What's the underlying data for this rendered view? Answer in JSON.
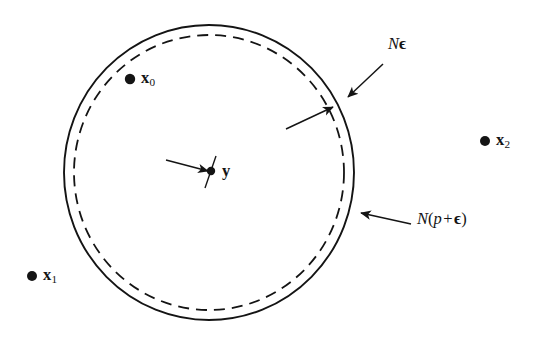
{
  "figure": {
    "name": "epsilon-neighborhood-diagram",
    "background_color": "#ffffff",
    "stroke_color": "#141414",
    "width": 548,
    "height": 346
  },
  "shapes": {
    "outer_circle": {
      "name": "N(p + ε) boundary",
      "style": "solid",
      "cx": 209,
      "cy": 172.5,
      "rx": 145,
      "ry": 147.5
    },
    "inner_circle": {
      "name": "Nε boundary",
      "style": "dashed",
      "cx": 209,
      "cy": 172.5,
      "rx": 135,
      "ry": 137.5
    }
  },
  "points": [
    {
      "id": "x0",
      "label_html": "x<sub>0</sub>",
      "text": "x0",
      "dot_x": 130,
      "dot_y": 79,
      "label_x": 141,
      "label_y": 71,
      "dot_r": 5.2,
      "inside_region": true
    },
    {
      "id": "x1",
      "label_html": "x<sub>1</sub>",
      "text": "x1",
      "dot_x": 32,
      "dot_y": 276,
      "label_x": 43,
      "label_y": 268,
      "dot_r": 5.0,
      "inside_region": false
    },
    {
      "id": "x2",
      "label_html": "x<sub>2</sub>",
      "text": "x2",
      "dot_x": 485,
      "dot_y": 141,
      "label_x": 496,
      "label_y": 133,
      "dot_r": 5.0,
      "inside_region": false
    },
    {
      "id": "y",
      "label_html": "y",
      "text": "y",
      "dot_x": 211,
      "dot_y": 171,
      "label_x": 222,
      "label_y": 163,
      "dot_r": 4.2,
      "inside_region": true
    }
  ],
  "annotations": [
    {
      "id": "n-epsilon",
      "text": "Nϵ",
      "parts": [
        {
          "kind": "italic",
          "text": "N"
        },
        {
          "kind": "epsilon",
          "text": "ϵ"
        }
      ],
      "label_x": 388,
      "label_y": 44,
      "arrow": {
        "tail_x": 383,
        "tail_y": 64,
        "tip_x": 348,
        "tip_y": 97
      }
    },
    {
      "id": "n-p-plus-epsilon",
      "text": "N(p + ϵ)",
      "parts": [
        {
          "kind": "italic",
          "text": "N"
        },
        {
          "kind": "paren",
          "text": "("
        },
        {
          "kind": "italic",
          "text": "p"
        },
        {
          "kind": "op",
          "text": "+"
        },
        {
          "kind": "epsilon",
          "text": "ϵ"
        },
        {
          "kind": "paren",
          "text": ")"
        }
      ],
      "label_x": 417,
      "label_y": 219,
      "arrow": {
        "tail_x": 411,
        "tail_y": 224,
        "tip_x": 361,
        "tip_y": 213
      }
    },
    {
      "id": "annulus-pointer",
      "text": "",
      "parts": [],
      "label_x": null,
      "label_y": null,
      "arrow": {
        "tail_x": 286,
        "tail_y": 129,
        "tip_x": 333,
        "tip_y": 107
      }
    },
    {
      "id": "center-pointer",
      "text": "",
      "parts": [],
      "label_x": null,
      "label_y": null,
      "arrow": {
        "tail_x": 166,
        "tail_y": 160,
        "tip_x": 208,
        "tip_y": 171
      }
    }
  ],
  "center_tick": {
    "name": "center-cross-tick",
    "x1": 216,
    "y1": 156,
    "x2": 205,
    "y2": 188
  }
}
